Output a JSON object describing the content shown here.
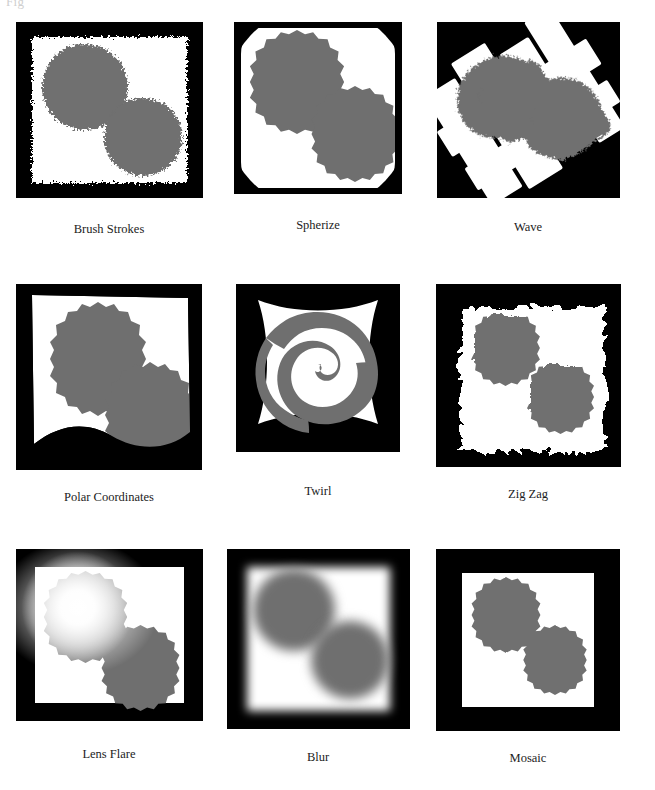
{
  "page": {
    "running_head": "Fig",
    "background_color": "#ffffff"
  },
  "figure": {
    "name": "filter-effects-grid",
    "columns": 3,
    "rows": 3,
    "palette": {
      "frame_black": "#000000",
      "canvas_white": "#ffffff",
      "object_gray": "#6f6f6f",
      "caption_text": "#1c1c1c"
    },
    "panels": [
      {
        "id": "brush-strokes",
        "caption": "Brush Strokes",
        "effect": "brush-strokes"
      },
      {
        "id": "spherize",
        "caption": "Spherize",
        "effect": "spherize"
      },
      {
        "id": "wave",
        "caption": "Wave",
        "effect": "wave"
      },
      {
        "id": "polar-coordinates",
        "caption": "Polar Coordinates",
        "effect": "polar-coordinates"
      },
      {
        "id": "twirl",
        "caption": "Twirl",
        "effect": "twirl"
      },
      {
        "id": "zig-zag",
        "caption": "Zig Zag",
        "effect": "zig-zag"
      },
      {
        "id": "lens-flare",
        "caption": "Lens Flare",
        "effect": "lens-flare"
      },
      {
        "id": "blur",
        "caption": "Blur",
        "effect": "blur"
      },
      {
        "id": "mosaic",
        "caption": "Mosaic",
        "effect": "mosaic"
      }
    ]
  }
}
